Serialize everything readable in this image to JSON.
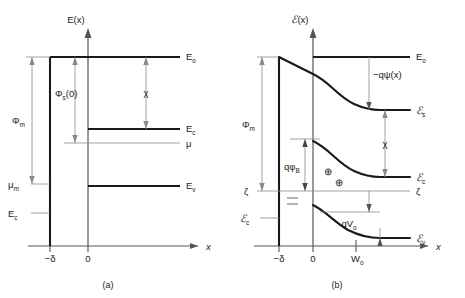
{
  "figure": {
    "background": "#ffffff",
    "line_color": "#1a1a1a",
    "thin_line_color": "#8a8a8a",
    "axis_color": "#555555"
  },
  "panel_a": {
    "caption": "(a)",
    "y_axis_label": "E(x)",
    "x_axis_label": "x",
    "x_ticks": [
      {
        "label": "−δ"
      },
      {
        "label": "0"
      }
    ],
    "level_labels": {
      "vacuum": "E",
      "vacuum_sub": "o",
      "conduction": "E",
      "conduction_sub": "c",
      "fermi": "μ",
      "valence": "E",
      "valence_sub": "v",
      "metal_fermi": "μ",
      "metal_fermi_sub": "m",
      "metal_bottom": "E",
      "metal_bottom_sub": "c"
    },
    "dimension_labels": {
      "metal_workfunction": "Φ",
      "metal_workfunction_sub": "m",
      "semi_workfunction": "Φ",
      "semi_workfunction_sub": "s",
      "semi_workfunction_arg": "(0)",
      "affinity": "χ"
    }
  },
  "panel_b": {
    "caption": "(b)",
    "y_axis_label_script": "ℰ",
    "y_axis_label_arg": "(x)",
    "x_axis_label": "x",
    "x_ticks": [
      {
        "label": "−δ"
      },
      {
        "label": "0"
      },
      {
        "label": "W",
        "sub": "o"
      }
    ],
    "level_labels": {
      "vacuum": "E",
      "vacuum_sub": "o",
      "vacuum_semi_script": "ℰ",
      "vacuum_semi_sub": "s",
      "conduction_script": "ℰ",
      "conduction_sub": "c",
      "fermi_left": "ζ",
      "fermi_right": "ζ",
      "valence_script": "ℰ",
      "valence_sub": "v",
      "metal_bottom_script": "ℰ",
      "metal_bottom_sub": "c"
    },
    "dimension_labels": {
      "metal_workfunction": "Φ",
      "metal_workfunction_sub": "m",
      "band_bending": "−qψ",
      "band_bending_arg": "(x)",
      "affinity": "χ",
      "barrier_height": "qφ",
      "barrier_height_sub": "B",
      "built_in_potential": "qV",
      "built_in_potential_sub": "o"
    },
    "charge_symbols": {
      "positive": "⊕",
      "positive_count": 2,
      "negative": "−",
      "negative_count": 2
    }
  }
}
